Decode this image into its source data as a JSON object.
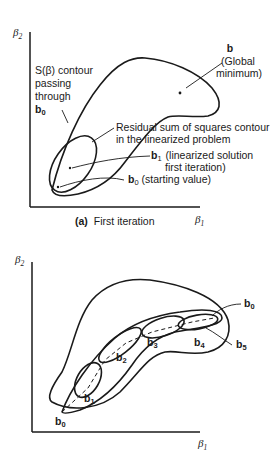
{
  "header_fragment": "",
  "figure_a": {
    "y_axis_label": "β",
    "y_axis_sub": "2",
    "x_axis_label": "β",
    "x_axis_sub": "1",
    "caption_tag": "(a)",
    "caption_text": "First iteration",
    "annotations": {
      "global_min_b": "b",
      "global_min_line1": "(Global",
      "global_min_line2": "minimum)",
      "s_contour_line1": "S(β) contour",
      "s_contour_line2": "passing",
      "s_contour_line3": "through",
      "s_contour_b": "b",
      "s_contour_sub": "0",
      "rss_line1": "Residual sum of squares contour",
      "rss_line2": "in the linearized problem",
      "b1_label": "b",
      "b1_sub": "1",
      "b1_desc_line1": "(linearized solution",
      "b1_desc_line2": "first iteration)",
      "b0_label": "b",
      "b0_sub": "0",
      "b0_desc": "(starting value)"
    }
  },
  "figure_b": {
    "y_axis_label": "β",
    "y_axis_sub": "2",
    "x_axis_label": "β",
    "x_axis_sub": "1",
    "points": [
      {
        "label": "b",
        "sub": "0",
        "position": "start"
      },
      {
        "label": "b",
        "sub": "1"
      },
      {
        "label": "b",
        "sub": "2"
      },
      {
        "label": "b",
        "sub": "3"
      },
      {
        "label": "b",
        "sub": "4"
      },
      {
        "label": "b",
        "sub": "5"
      },
      {
        "label": "b",
        "sub": "0",
        "position": "outer-contour"
      }
    ]
  }
}
